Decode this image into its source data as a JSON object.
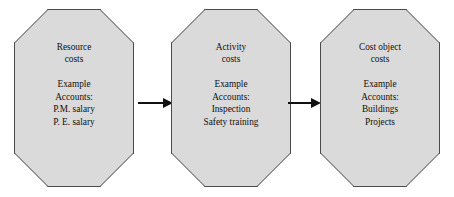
{
  "diagram": {
    "type": "flow",
    "background_color": "#ffffff",
    "node_fill_color": "#dadada",
    "node_border_color": "#4a4a4a",
    "arrow_color": "#111111",
    "nodes": [
      {
        "id": "resource-costs",
        "title_lines": [
          "Resource",
          "costs"
        ],
        "detail_lines": [
          "Example",
          "Accounts:",
          "P.M. salary",
          "P. E. salary"
        ]
      },
      {
        "id": "activity-costs",
        "title_lines": [
          "Activity",
          "costs"
        ],
        "detail_lines": [
          "Example",
          "Accounts:",
          "Inspection",
          "Safety training"
        ]
      },
      {
        "id": "cost-object-costs",
        "title_lines": [
          "Cost object",
          "costs"
        ],
        "detail_lines": [
          "Example",
          "Accounts:",
          "Buildings",
          "Projects"
        ]
      }
    ],
    "connectors": [
      {
        "id": "arrow-resource-to-activity",
        "from": "resource-costs",
        "to": "activity-costs",
        "style": "solid-arrow"
      },
      {
        "id": "arrow-activity-to-cost-object",
        "from": "activity-costs",
        "to": "cost-object-costs",
        "style": "solid-arrow"
      }
    ]
  }
}
